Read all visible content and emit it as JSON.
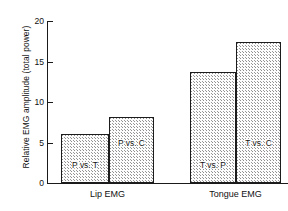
{
  "chart_data": {
    "type": "bar",
    "title": "",
    "subtitle": "",
    "xlabel": "",
    "ylabel": "Relative EMG amplitude  (total power)",
    "ylim": [
      0,
      20
    ],
    "yticks": [
      0,
      5,
      10,
      15,
      20
    ],
    "ytick_labels": [
      "0",
      "5",
      "10",
      "15",
      "20"
    ],
    "grid": false,
    "legend": "none",
    "categories": [
      "Lip EMG",
      "Tongue EMG"
    ],
    "bars": [
      {
        "label": "P vs. T",
        "value": 6.0,
        "group": "Lip EMG"
      },
      {
        "label": "P vs. C",
        "value": 8.1,
        "group": "Lip EMG"
      },
      {
        "label": "T vs. P",
        "value": 13.7,
        "group": "Tongue EMG"
      },
      {
        "label": "T vs. C",
        "value": 17.4,
        "group": "Tongue EMG"
      }
    ],
    "bar_fill": "stippled",
    "bar_edge_color": "#1c1c1c",
    "axis_color": "#1a1a1a",
    "background_color": "#ffffff"
  }
}
